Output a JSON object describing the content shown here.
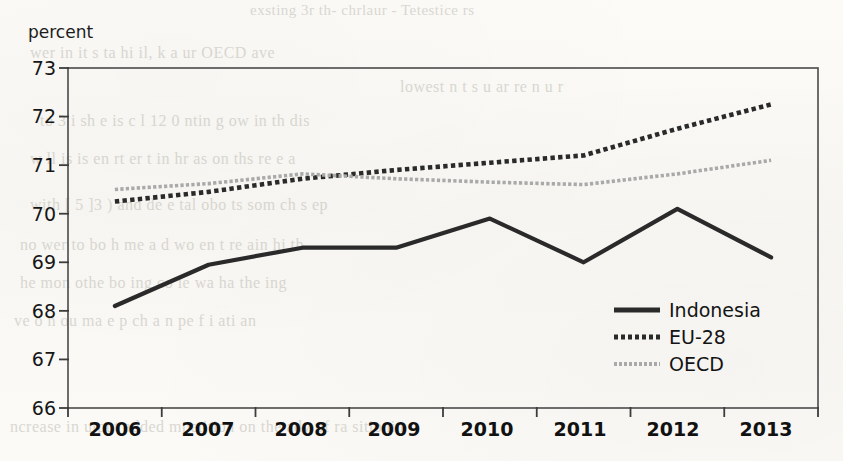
{
  "axis": {
    "y_title": "percent",
    "y_ticks": [
      "73",
      "72",
      "71",
      "70",
      "69",
      "68",
      "67",
      "66"
    ],
    "x_ticks": [
      "2006",
      "2007",
      "2008",
      "2009",
      "2010",
      "2011",
      "2012",
      "2013"
    ]
  },
  "legend": {
    "position": "inside-bottom-right",
    "items": [
      {
        "label": "Indonesia",
        "style": "solid",
        "color": "#2a2a2a"
      },
      {
        "label": "EU-28",
        "style": "dotted",
        "color": "#2a2a2a"
      },
      {
        "label": "OECD",
        "style": "fine-dotted",
        "color": "#a9a9a9"
      }
    ]
  },
  "ghost_text": {
    "lines": [
      "exsting 3r th- chrlaur  - Tetestice rs",
      "wer  in it   s    ta  hi  il, k a   ur  OECD ave",
      "lowest   n  t  s  u   ar re   n  u  r",
      "to   3  i sh   e  is  c  l  12  0 ntin   g  ow in  th  dis",
      "w  ll is is  en  rt  er t   in  hr   as  on  ths  re   e  a",
      "with [ 5 ]3 ) and de    e  tal  obo   ts  som  ch  s  ep",
      "no  wer  to bo h  me  a d  wo en  t  re ain  hi  th",
      "he   mon   othe     bo   ing  co  ie      wa   ha   the  ing",
      "ve  o  n  ou  ma    e  p ch   a    n  pe f   i   ati  an",
      "ncrease in utput  added  mpetition  on the adv    of  ra  sitionin"
    ]
  },
  "chart_data": {
    "type": "line",
    "title": "",
    "xlabel": "",
    "ylabel": "percent",
    "ylim": [
      66,
      73
    ],
    "grid": false,
    "x": [
      "2006",
      "2007",
      "2008",
      "2009",
      "2010",
      "2011",
      "2012",
      "2013"
    ],
    "series": [
      {
        "name": "Indonesia",
        "style": "solid",
        "color": "#2a2a2a",
        "width": 4.2,
        "values": [
          68.1,
          68.95,
          69.3,
          69.3,
          69.9,
          69.0,
          70.1,
          69.1
        ]
      },
      {
        "name": "EU-28",
        "style": "dotted",
        "color": "#2a2a2a",
        "width": 4.6,
        "values": [
          70.25,
          70.45,
          70.72,
          70.9,
          71.05,
          71.2,
          71.75,
          72.25
        ]
      },
      {
        "name": "OECD",
        "style": "fine-dotted",
        "color": "#a9a9a9",
        "width": 3.6,
        "values": [
          70.5,
          70.62,
          70.82,
          70.72,
          70.65,
          70.6,
          70.82,
          71.1
        ]
      }
    ]
  },
  "plot_geometry": {
    "left": 68,
    "right": 818,
    "top": 68,
    "bottom": 408
  }
}
